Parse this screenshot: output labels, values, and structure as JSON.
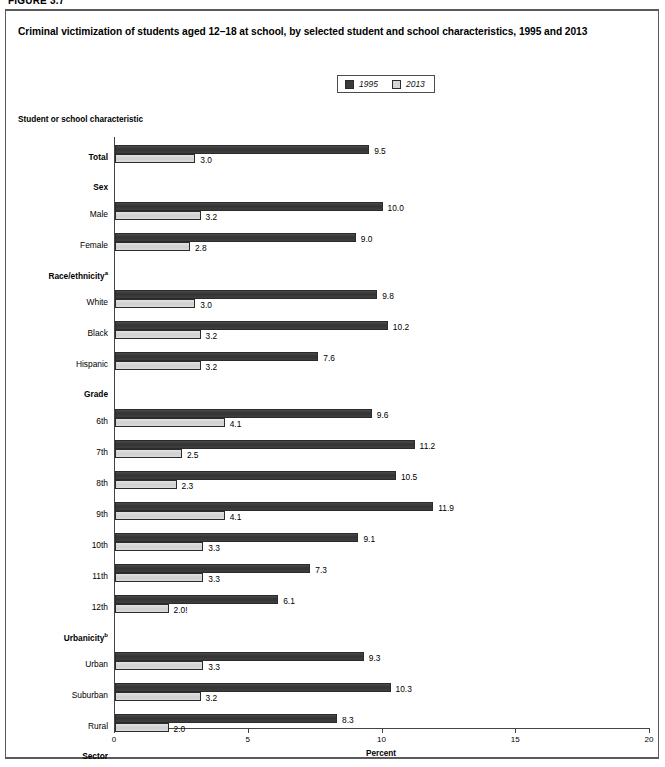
{
  "figure_label": "FIGURE 3.7",
  "title": "Criminal victimization of students aged 12–18 at school, by selected student and school characteristics, 1995 and 2013",
  "axis_heading": "Student or school characteristic",
  "legend": {
    "items": [
      {
        "label": "1995",
        "color": "#3b3b3b",
        "swatch": "dark-square-swatch"
      },
      {
        "label": "2013",
        "color": "#d6d6d6",
        "swatch": "light-square-swatch"
      }
    ]
  },
  "chart_data": {
    "type": "bar",
    "orientation": "horizontal",
    "title": "Criminal victimization of students aged 12–18 at school, by selected student and school characteristics, 1995 and 2013",
    "xlabel": "Percent",
    "ylabel": "Student or school characteristic",
    "xlim": [
      0,
      20
    ],
    "xticks": [
      "0",
      "5",
      "10",
      "15",
      "20"
    ],
    "grid": false,
    "legend_position": "top-center",
    "categories": [
      "Total",
      "Male",
      "Female",
      "White",
      "Black",
      "Hispanic",
      "6th",
      "7th",
      "8th",
      "9th",
      "10th",
      "11th",
      "12th",
      "Urban",
      "Suburban",
      "Rural",
      "Public",
      "Private"
    ],
    "group_headings": [
      "Sex",
      "Race/ethnicity",
      "Grade",
      "Urbanicity",
      "Sector"
    ],
    "series": [
      {
        "name": "1995",
        "color": "#3b3b3b",
        "values": [
          9.5,
          10.0,
          9.0,
          9.8,
          10.2,
          7.6,
          9.6,
          11.2,
          10.5,
          11.9,
          9.1,
          7.3,
          6.1,
          9.3,
          10.3,
          8.3,
          9.8,
          6.6
        ],
        "labels": [
          "9.5",
          "10.0",
          "9.0",
          "9.8",
          "10.2",
          "7.6",
          "9.6",
          "11.2",
          "10.5",
          "11.9",
          "9.1",
          "7.3",
          "6.1",
          "9.3",
          "10.3",
          "8.3",
          "9.8",
          "6.6"
        ]
      },
      {
        "name": "2013",
        "color": "#d6d6d6",
        "values": [
          3.0,
          3.2,
          2.8,
          3.0,
          3.2,
          3.2,
          4.1,
          2.5,
          2.3,
          4.1,
          3.3,
          3.3,
          2.0,
          3.3,
          3.2,
          2.0,
          3.1,
          2.8
        ],
        "labels": [
          "3.0",
          "3.2",
          "2.8",
          "3.0",
          "3.2",
          "3.2",
          "4.1",
          "2.5",
          "2.3",
          "4.1",
          "3.3",
          "3.3",
          "2.0!",
          "3.3",
          "3.2",
          "2.0",
          "3.1",
          "2.8"
        ]
      }
    ]
  },
  "rows": [
    {
      "kind": "row",
      "label": "Total",
      "bold": true,
      "sup": "",
      "v1995": 9.5,
      "l1995": "9.5",
      "v2013": 3.0,
      "l2013": "3.0",
      "sup2013": ""
    },
    {
      "kind": "group",
      "label": "Sex",
      "sup": ""
    },
    {
      "kind": "row",
      "label": "Male",
      "bold": false,
      "sup": "",
      "v1995": 10.0,
      "l1995": "10.0",
      "v2013": 3.2,
      "l2013": "3.2",
      "sup2013": ""
    },
    {
      "kind": "row",
      "label": "Female",
      "bold": false,
      "sup": "",
      "v1995": 9.0,
      "l1995": "9.0",
      "v2013": 2.8,
      "l2013": "2.8",
      "sup2013": ""
    },
    {
      "kind": "group",
      "label": "Race/ethnicity",
      "sup": "a"
    },
    {
      "kind": "row",
      "label": "White",
      "bold": false,
      "sup": "",
      "v1995": 9.8,
      "l1995": "9.8",
      "v2013": 3.0,
      "l2013": "3.0",
      "sup2013": ""
    },
    {
      "kind": "row",
      "label": "Black",
      "bold": false,
      "sup": "",
      "v1995": 10.2,
      "l1995": "10.2",
      "v2013": 3.2,
      "l2013": "3.2",
      "sup2013": ""
    },
    {
      "kind": "row",
      "label": "Hispanic",
      "bold": false,
      "sup": "",
      "v1995": 7.6,
      "l1995": "7.6",
      "v2013": 3.2,
      "l2013": "3.2",
      "sup2013": ""
    },
    {
      "kind": "group",
      "label": "Grade",
      "sup": ""
    },
    {
      "kind": "row",
      "label": "6th",
      "bold": false,
      "sup": "",
      "v1995": 9.6,
      "l1995": "9.6",
      "v2013": 4.1,
      "l2013": "4.1",
      "sup2013": ""
    },
    {
      "kind": "row",
      "label": "7th",
      "bold": false,
      "sup": "",
      "v1995": 11.2,
      "l1995": "11.2",
      "v2013": 2.5,
      "l2013": "2.5",
      "sup2013": ""
    },
    {
      "kind": "row",
      "label": "8th",
      "bold": false,
      "sup": "",
      "v1995": 10.5,
      "l1995": "10.5",
      "v2013": 2.3,
      "l2013": "2.3",
      "sup2013": ""
    },
    {
      "kind": "row",
      "label": "9th",
      "bold": false,
      "sup": "",
      "v1995": 11.9,
      "l1995": "11.9",
      "v2013": 4.1,
      "l2013": "4.1",
      "sup2013": ""
    },
    {
      "kind": "row",
      "label": "10th",
      "bold": false,
      "sup": "",
      "v1995": 9.1,
      "l1995": "9.1",
      "v2013": 3.3,
      "l2013": "3.3",
      "sup2013": ""
    },
    {
      "kind": "row",
      "label": "11th",
      "bold": false,
      "sup": "",
      "v1995": 7.3,
      "l1995": "7.3",
      "v2013": 3.3,
      "l2013": "3.3",
      "sup2013": ""
    },
    {
      "kind": "row",
      "label": "12th",
      "bold": false,
      "sup": "",
      "v1995": 6.1,
      "l1995": "6.1",
      "v2013": 2.0,
      "l2013": "2.0!",
      "sup2013": ""
    },
    {
      "kind": "group",
      "label": "Urbanicity",
      "sup": "b"
    },
    {
      "kind": "row",
      "label": "Urban",
      "bold": false,
      "sup": "",
      "v1995": 9.3,
      "l1995": "9.3",
      "v2013": 3.3,
      "l2013": "3.3",
      "sup2013": ""
    },
    {
      "kind": "row",
      "label": "Suburban",
      "bold": false,
      "sup": "",
      "v1995": 10.3,
      "l1995": "10.3",
      "v2013": 3.2,
      "l2013": "3.2",
      "sup2013": ""
    },
    {
      "kind": "row",
      "label": "Rural",
      "bold": false,
      "sup": "",
      "v1995": 8.3,
      "l1995": "8.3",
      "v2013": 2.0,
      "l2013": "2.0",
      "sup2013": ""
    },
    {
      "kind": "group",
      "label": "Sector",
      "sup": ""
    },
    {
      "kind": "row",
      "label": "Public",
      "bold": false,
      "sup": "",
      "v1995": 9.8,
      "l1995": "9.8",
      "v2013": 3.1,
      "l2013": "3.1",
      "sup2013": ""
    },
    {
      "kind": "row",
      "label": "Private",
      "bold": false,
      "sup": "",
      "v1995": 6.6,
      "l1995": "6.6",
      "v2013": 2.8,
      "l2013": "2.8",
      "sup2013": "c"
    }
  ]
}
